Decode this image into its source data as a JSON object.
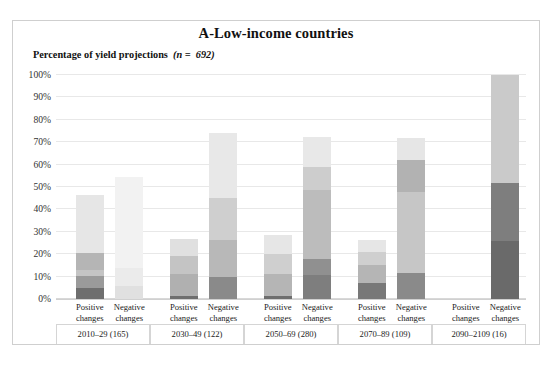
{
  "figure": {
    "title": "A-Low-income countries",
    "y_axis_title_main": "Percentage of yield projections",
    "y_axis_title_n": "(n =  692)",
    "n_italic": "n"
  },
  "chart_data": {
    "type": "bar",
    "title": "A-Low-income countries",
    "subtitle": "Percentage of yield projections (n = 692)",
    "stacked": true,
    "xlabel": "",
    "ylabel": "Percentage of yield projections",
    "ylim": [
      0,
      100
    ],
    "ytick_labels": [
      "0%",
      "10%",
      "20%",
      "30%",
      "40%",
      "50%",
      "60%",
      "70%",
      "80%",
      "90%",
      "100%"
    ],
    "ytick_values": [
      0,
      10,
      20,
      30,
      40,
      50,
      60,
      70,
      80,
      90,
      100
    ],
    "grid": true,
    "legend": "none",
    "groups": [
      {
        "label": "2010–29 (165)",
        "period": "2010–29",
        "count": 165
      },
      {
        "label": "2030–49 (122)",
        "period": "2030–49",
        "count": 122
      },
      {
        "label": "2050–69 (280)",
        "period": "2050–69",
        "count": 280
      },
      {
        "label": "2070–89 (109)",
        "period": "2070–89",
        "count": 109
      },
      {
        "label": "2090–2109 (16)",
        "period": "2090–2109",
        "count": 16
      }
    ],
    "categories": [
      "Positive changes",
      "Negative changes",
      "Positive changes",
      "Negative changes",
      "Positive changes",
      "Negative changes",
      "Positive changes",
      "Negative changes",
      "Positive changes",
      "Negative changes"
    ],
    "category_line1": "Positive",
    "category_line2": "changes",
    "category_neg_line1": "Negative",
    "segment_colors": [
      "#6e6e6e",
      "#8f8f8f",
      "#aeaeae",
      "#c9c9c9",
      "#dedede",
      "#efefef"
    ],
    "bars": [
      {
        "group": "2010–29 (165)",
        "direction": "Positive changes",
        "total": 46.5,
        "segments": [
          {
            "value": 5.0,
            "from": 0.0,
            "to": 5.0,
            "color": "#6e6e6e"
          },
          {
            "value": 5.5,
            "from": 5.0,
            "to": 10.5,
            "color": "#9a9a9a"
          },
          {
            "value": 2.5,
            "from": 10.5,
            "to": 13.0,
            "color": "#c4c4c4"
          },
          {
            "value": 7.5,
            "from": 13.0,
            "to": 20.5,
            "color": "#b5b5b5"
          },
          {
            "value": 26.0,
            "from": 20.5,
            "to": 46.5,
            "color": "#e6e6e6"
          }
        ]
      },
      {
        "group": "2010–29 (165)",
        "direction": "Negative changes",
        "total": 54.5,
        "segments": [
          {
            "value": 6.0,
            "from": 0.0,
            "to": 6.0,
            "color": "#e0e0e0"
          },
          {
            "value": 8.0,
            "from": 6.0,
            "to": 14.0,
            "color": "#ebebeb"
          },
          {
            "value": 40.5,
            "from": 14.0,
            "to": 54.5,
            "color": "#f2f2f2"
          }
        ]
      },
      {
        "group": "2030–49 (122)",
        "direction": "Positive changes",
        "total": 27.0,
        "segments": [
          {
            "value": 1.5,
            "from": 0.0,
            "to": 1.5,
            "color": "#6e6e6e"
          },
          {
            "value": 9.5,
            "from": 1.5,
            "to": 11.0,
            "color": "#b0b0b0"
          },
          {
            "value": 8.0,
            "from": 11.0,
            "to": 19.0,
            "color": "#c4c4c4"
          },
          {
            "value": 8.0,
            "from": 19.0,
            "to": 27.0,
            "color": "#e0e0e0"
          }
        ]
      },
      {
        "group": "2030–49 (122)",
        "direction": "Negative changes",
        "total": 74.0,
        "segments": [
          {
            "value": 10.0,
            "from": 0.0,
            "to": 10.0,
            "color": "#8a8a8a"
          },
          {
            "value": 16.5,
            "from": 10.0,
            "to": 26.5,
            "color": "#b8b8b8"
          },
          {
            "value": 18.5,
            "from": 26.5,
            "to": 45.0,
            "color": "#cfcfcf"
          },
          {
            "value": 29.0,
            "from": 45.0,
            "to": 74.0,
            "color": "#e8e8e8"
          }
        ]
      },
      {
        "group": "2050–69 (280)",
        "direction": "Positive changes",
        "total": 28.5,
        "segments": [
          {
            "value": 1.5,
            "from": 0.0,
            "to": 1.5,
            "color": "#6e6e6e"
          },
          {
            "value": 9.5,
            "from": 1.5,
            "to": 11.0,
            "color": "#b5b5b5"
          },
          {
            "value": 9.0,
            "from": 11.0,
            "to": 20.0,
            "color": "#cfcfcf"
          },
          {
            "value": 8.5,
            "from": 20.0,
            "to": 28.5,
            "color": "#e6e6e6"
          }
        ]
      },
      {
        "group": "2050–69 (280)",
        "direction": "Negative changes",
        "total": 72.5,
        "segments": [
          {
            "value": 10.5,
            "from": 0.0,
            "to": 10.5,
            "color": "#7e7e7e"
          },
          {
            "value": 7.5,
            "from": 10.5,
            "to": 18.0,
            "color": "#909090"
          },
          {
            "value": 30.5,
            "from": 18.0,
            "to": 48.5,
            "color": "#bcbcbc"
          },
          {
            "value": 10.5,
            "from": 48.5,
            "to": 59.0,
            "color": "#cdcdcd"
          },
          {
            "value": 13.5,
            "from": 59.0,
            "to": 72.5,
            "color": "#e8e8e8"
          }
        ]
      },
      {
        "group": "2070–89 (109)",
        "direction": "Positive changes",
        "total": 26.5,
        "segments": [
          {
            "value": 7.0,
            "from": 0.0,
            "to": 7.0,
            "color": "#787878"
          },
          {
            "value": 8.0,
            "from": 7.0,
            "to": 15.0,
            "color": "#b5b5b5"
          },
          {
            "value": 6.0,
            "from": 15.0,
            "to": 21.0,
            "color": "#cfcfcf"
          },
          {
            "value": 5.5,
            "from": 21.0,
            "to": 26.5,
            "color": "#e6e6e6"
          }
        ]
      },
      {
        "group": "2070–89 (109)",
        "direction": "Negative changes",
        "total": 72.0,
        "segments": [
          {
            "value": 11.5,
            "from": 0.0,
            "to": 11.5,
            "color": "#8a8a8a"
          },
          {
            "value": 36.5,
            "from": 11.5,
            "to": 48.0,
            "color": "#c6c6c6"
          },
          {
            "value": 14.0,
            "from": 48.0,
            "to": 62.0,
            "color": "#b2b2b2"
          },
          {
            "value": 10.0,
            "from": 62.0,
            "to": 72.0,
            "color": "#e6e6e6"
          }
        ]
      },
      {
        "group": "2090–2109 (16)",
        "direction": "Positive changes",
        "total": 0.0,
        "segments": []
      },
      {
        "group": "2090–2109 (16)",
        "direction": "Negative changes",
        "total": 100.0,
        "segments": [
          {
            "value": 26.0,
            "from": 0.0,
            "to": 26.0,
            "color": "#6a6a6a"
          },
          {
            "value": 26.0,
            "from": 26.0,
            "to": 52.0,
            "color": "#7e7e7e"
          },
          {
            "value": 48.0,
            "from": 52.0,
            "to": 100.0,
            "color": "#cacaca"
          }
        ]
      }
    ]
  }
}
